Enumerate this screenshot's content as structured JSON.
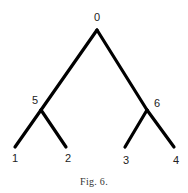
{
  "figure": {
    "caption": "Fig. 6.",
    "nodes": [
      {
        "id": "0",
        "label": "0",
        "x": 97,
        "y": 30,
        "lx": 97,
        "ly": 21
      },
      {
        "id": "5",
        "label": "5",
        "x": 41,
        "y": 110,
        "lx": 35,
        "ly": 104
      },
      {
        "id": "6",
        "label": "6",
        "x": 147,
        "y": 110,
        "lx": 157,
        "ly": 107
      },
      {
        "id": "1",
        "label": "1",
        "x": 15,
        "y": 147,
        "lx": 15,
        "ly": 162
      },
      {
        "id": "2",
        "label": "2",
        "x": 66,
        "y": 147,
        "lx": 68,
        "ly": 162
      },
      {
        "id": "3",
        "label": "3",
        "x": 125,
        "y": 147,
        "lx": 126,
        "ly": 164
      },
      {
        "id": "4",
        "label": "4",
        "x": 174,
        "y": 147,
        "lx": 176,
        "ly": 164
      }
    ],
    "edges": [
      [
        "0",
        "5"
      ],
      [
        "0",
        "6"
      ],
      [
        "5",
        "1"
      ],
      [
        "5",
        "2"
      ],
      [
        "6",
        "3"
      ],
      [
        "6",
        "4"
      ]
    ]
  }
}
